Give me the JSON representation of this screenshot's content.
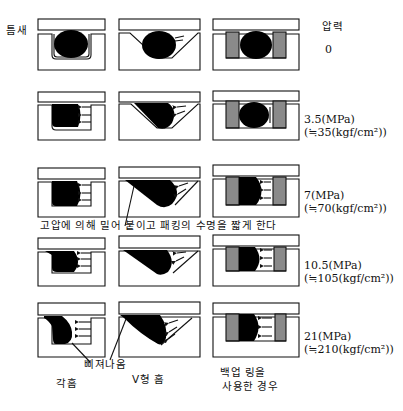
{
  "labels": {
    "gap": "틈새",
    "pressure_header": "압력",
    "high_pressure_note": "고압에 의해 밀어 붙이고 패킹의 수명을 짧게 한다",
    "extrusion": "삐져나옴"
  },
  "columns": [
    {
      "id": "rectangular-groove",
      "label": "각홈"
    },
    {
      "id": "v-groove",
      "label": "V형 홈"
    },
    {
      "id": "backup-ring",
      "label_line1": "백업 링을",
      "label_line2": "사용한 경우"
    }
  ],
  "rows": [
    {
      "pressure_mpa": "0",
      "pressure_kgf": ""
    },
    {
      "pressure_mpa": "3.5(MPa)",
      "pressure_kgf": "(≒35(kgf/cm²))"
    },
    {
      "pressure_mpa": "7(MPa)",
      "pressure_kgf": "(≒70(kgf/cm²))"
    },
    {
      "pressure_mpa": "10.5(MPa)",
      "pressure_kgf": "(≒105(kgf/cm²))"
    },
    {
      "pressure_mpa": "21(MPa)",
      "pressure_kgf": "(≒210(kgf/cm²))"
    }
  ],
  "colors": {
    "ink": "#111111",
    "oring_fill": "#000000",
    "backup_ring_fill": "#8a8a8a",
    "background": "#ffffff"
  }
}
